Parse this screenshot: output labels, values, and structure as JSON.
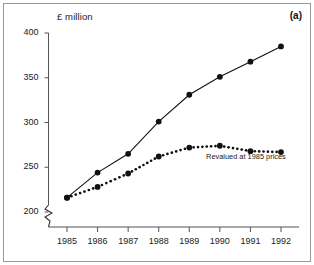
{
  "figure": {
    "panel_label": "(a)",
    "yaxis_unit_label": "£ million",
    "frame_color": "#9a9a9a",
    "background_color": "#ffffff",
    "ink_color": "#111111"
  },
  "chart_data": {
    "type": "line",
    "title": "",
    "subtitle": "",
    "xlabel": "",
    "ylabel": "£ million",
    "categories": [
      "1985",
      "1986",
      "1987",
      "1988",
      "1989",
      "1990",
      "1991",
      "1992"
    ],
    "x": [
      1985,
      1986,
      1987,
      1988,
      1989,
      1990,
      1991,
      1992
    ],
    "xlim": [
      1985,
      1992
    ],
    "ylim": [
      200,
      400
    ],
    "yticks": [
      200,
      250,
      300,
      350,
      400
    ],
    "ytick_labels": [
      "200",
      "250",
      "300",
      "350",
      "400"
    ],
    "xtick_labels": [
      "1985",
      "1986",
      "1987",
      "1988",
      "1989",
      "1990",
      "1991",
      "1992"
    ],
    "y_axis_broken": true,
    "y_axis_break_note": "zigzag break below 200",
    "grid": false,
    "legend_position": "inline-annotation",
    "series": [
      {
        "name": "Cash terms",
        "style": "solid",
        "marker": "filled-circle",
        "color": "#111111",
        "values": [
          216,
          244,
          265,
          301,
          331,
          351,
          368,
          385
        ]
      },
      {
        "name": "Revalued at 1985 prices",
        "style": "dotted",
        "marker": "filled-circle",
        "color": "#111111",
        "values": [
          216,
          228,
          243,
          262,
          272,
          274,
          268,
          267
        ]
      }
    ],
    "annotations": [
      {
        "text": "Revalued at 1985 prices",
        "x": 1989.55,
        "y": 262,
        "anchor": "start"
      }
    ]
  }
}
